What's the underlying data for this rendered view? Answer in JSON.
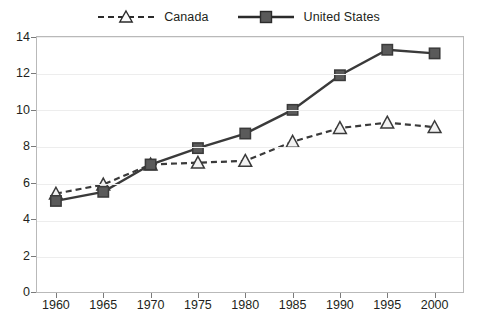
{
  "legend": {
    "entries": [
      {
        "label": "Canada",
        "style": "dashed-open-triangle",
        "color": "#231f20"
      },
      {
        "label": "United States",
        "style": "solid-filled-square",
        "color": "#231f20"
      }
    ]
  },
  "axes": {
    "y_ticks": [
      "0",
      "2",
      "4",
      "6",
      "8",
      "10",
      "12",
      "14"
    ],
    "x_ticks": [
      "1960",
      "1965",
      "1970",
      "1975",
      "1980",
      "1985",
      "1990",
      "1995",
      "2000"
    ]
  },
  "colors": {
    "series": "#3a3a3a",
    "marker_fill_canada": "#f2f2f2",
    "marker_fill_us": "#5a5a5a",
    "gridline": "#ededed",
    "frame": "#b9b9b9",
    "text": "#231f20"
  },
  "chart_data": {
    "type": "line",
    "title": "",
    "subtitle": "",
    "xlabel": "",
    "ylabel": "",
    "xlim": [
      1958,
      2003
    ],
    "ylim": [
      0,
      14
    ],
    "grid": true,
    "legend_position": "top-center",
    "x": [
      1960,
      1965,
      1970,
      1975,
      1980,
      1985,
      1990,
      1995,
      2000
    ],
    "series": [
      {
        "name": "Canada",
        "marker": "triangle-open",
        "line": "dashed",
        "values": [
          5.4,
          5.9,
          7.0,
          7.1,
          7.2,
          8.25,
          9.0,
          9.3,
          9.05
        ]
      },
      {
        "name": "United States",
        "marker": "square-filled",
        "line": "solid",
        "values": [
          5.0,
          5.5,
          7.0,
          7.9,
          8.7,
          10.0,
          11.9,
          13.3,
          13.1
        ]
      }
    ]
  }
}
